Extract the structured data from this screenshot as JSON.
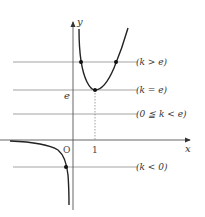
{
  "diagram": {
    "type": "function-graph-with-horizontal-lines",
    "axes": {
      "x_label": "x",
      "y_label": "y",
      "origin_label": "O",
      "x_tick_label": "1",
      "y_tick_label": "e"
    },
    "lines": [
      {
        "id": "k_gt_e",
        "label": "(k > e)",
        "intersections": 2
      },
      {
        "id": "k_eq_e",
        "label": "(k = e)",
        "intersections": 1
      },
      {
        "id": "k_0_to_e",
        "label": "(0 ≦ k < e)",
        "intersections": 0
      },
      {
        "id": "k_lt_0",
        "label": "(k < 0)",
        "intersections": 1
      }
    ],
    "curve": {
      "right_branch": "U-shaped, vertical asymptote at x=0, minimum at (1, e)",
      "left_branch": "negative, approaches 0 as x→-∞, →-∞ as x→0-"
    },
    "colors": {
      "curve": "#222222",
      "axes": "#555555",
      "guide_lines": "#999999",
      "text": "#333333"
    }
  }
}
